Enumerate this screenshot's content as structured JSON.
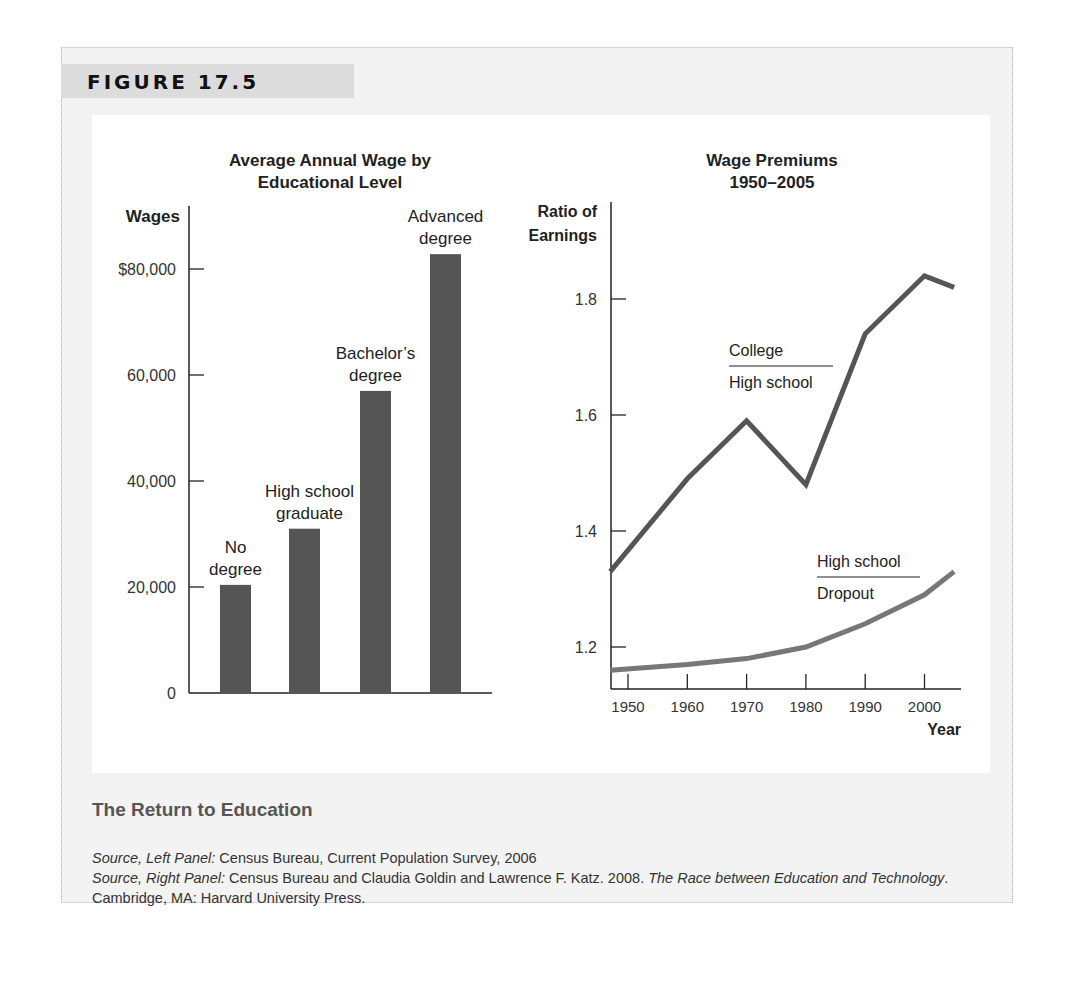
{
  "figure": {
    "label": "FIGURE 17.5",
    "caption_title": "The Return to Education",
    "sources": {
      "left_prefix": "Source, Left Panel:",
      "left_text": " Census Bureau, Current Population Survey, 2006",
      "right_prefix": "Source, Right Panel:",
      "right_text": " Census Bureau and Claudia Goldin and Lawrence F. Katz. 2008. ",
      "right_book": "The Race between Education and Technology",
      "right_tail": ". Cambridge, MA: Harvard University Press."
    }
  },
  "chart_data": [
    {
      "type": "bar",
      "title": "Average Annual Wage by Educational Level",
      "title_lines": [
        "Average Annual Wage by",
        "Educational Level"
      ],
      "xlabel": "",
      "ylabel": "Wages",
      "ylim": [
        0,
        90000
      ],
      "yticks": [
        0,
        20000,
        40000,
        60000,
        80000
      ],
      "ytick_labels": [
        "0",
        "20,000",
        "40,000",
        "60,000",
        "$80,000"
      ],
      "categories": [
        "No degree",
        "High school graduate",
        "Bachelor's degree",
        "Advanced degree"
      ],
      "category_label_lines": [
        [
          "No",
          "degree"
        ],
        [
          "High school",
          "graduate"
        ],
        [
          "Bachelor’s",
          "degree"
        ],
        [
          "Advanced",
          "degree"
        ]
      ],
      "values": [
        20400,
        31000,
        57000,
        82800
      ],
      "bar_color": "#555555",
      "grid": false,
      "legend": "none"
    },
    {
      "type": "line",
      "title": "Wage Premiums 1950–2005",
      "title_lines": [
        "Wage Premiums",
        "1950–2005"
      ],
      "xlabel": "Year",
      "ylabel": "Ratio of Earnings",
      "ylabel_lines": [
        "Ratio of",
        "Earnings"
      ],
      "xlim": [
        1947,
        2007
      ],
      "ylim": [
        1.13,
        1.92
      ],
      "xticks": [
        1950,
        1960,
        1970,
        1980,
        1990,
        2000
      ],
      "yticks": [
        1.2,
        1.4,
        1.6,
        1.8
      ],
      "ytick_labels": [
        "1.2",
        "1.4",
        "1.6",
        "1.8"
      ],
      "grid": false,
      "legend": "inline annotations",
      "series": [
        {
          "name": "College / High school",
          "label_top": "College",
          "label_bottom": "High school",
          "color": "#555555",
          "x": [
            1947,
            1960,
            1970,
            1980,
            1990,
            2000,
            2005
          ],
          "y": [
            1.33,
            1.49,
            1.59,
            1.48,
            1.74,
            1.84,
            1.82
          ]
        },
        {
          "name": "High school / Dropout",
          "label_top": "High school",
          "label_bottom": "Dropout",
          "color": "#777777",
          "x": [
            1947,
            1960,
            1970,
            1980,
            1990,
            2000,
            2005
          ],
          "y": [
            1.16,
            1.17,
            1.18,
            1.2,
            1.24,
            1.29,
            1.33
          ]
        }
      ]
    }
  ]
}
